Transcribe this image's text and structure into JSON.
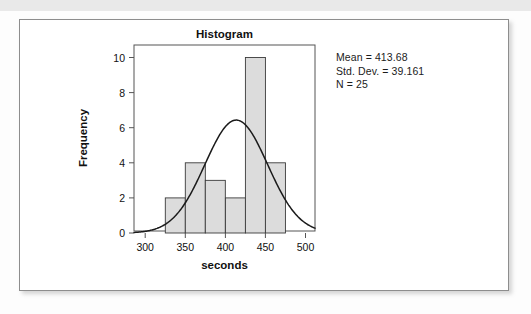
{
  "page": {
    "background_color": "#fdfdfd",
    "top_band_color": "#e9e9e9",
    "card_border_color": "#8d8d8d",
    "card_background": "#ffffff"
  },
  "chart_data": {
    "type": "bar",
    "title": "Histogram",
    "xlabel": "seconds",
    "ylabel": "Frequency",
    "xlim": [
      286,
      512
    ],
    "ylim": [
      0,
      10.6
    ],
    "grid": false,
    "legend": null,
    "bar_fill_color": "#dcdcdc",
    "bar_edge_color": "#3a3a3a",
    "curve_color": "#1a1a1a",
    "x_tick_labels": [
      "300",
      "350",
      "400",
      "450",
      "500"
    ],
    "x_tick_values": [
      300,
      350,
      400,
      450,
      500
    ],
    "y_tick_labels": [
      "0",
      "2",
      "4",
      "6",
      "8",
      "10"
    ],
    "y_tick_values": [
      0,
      2,
      4,
      6,
      8,
      10
    ],
    "bin_width": 25,
    "bins": [
      {
        "start": 325,
        "end": 350,
        "value": 2
      },
      {
        "start": 350,
        "end": 375,
        "value": 4
      },
      {
        "start": 375,
        "end": 400,
        "value": 3
      },
      {
        "start": 400,
        "end": 425,
        "value": 2
      },
      {
        "start": 425,
        "end": 450,
        "value": 10
      },
      {
        "start": 450,
        "end": 475,
        "value": 4
      }
    ],
    "categories": [
      "325-350",
      "350-375",
      "375-400",
      "400-425",
      "425-450",
      "450-475"
    ],
    "values": [
      2,
      4,
      3,
      2,
      10,
      4
    ],
    "normal_curve": {
      "mean": 413.68,
      "std_dev": 39.161,
      "n": 25,
      "scale_bin_width": 25,
      "peak_value": 6.36
    }
  },
  "statistics": {
    "mean_label": "Mean = 413.68",
    "std_dev_label": "Std. Dev. = 39.161",
    "n_label": "N = 25"
  }
}
